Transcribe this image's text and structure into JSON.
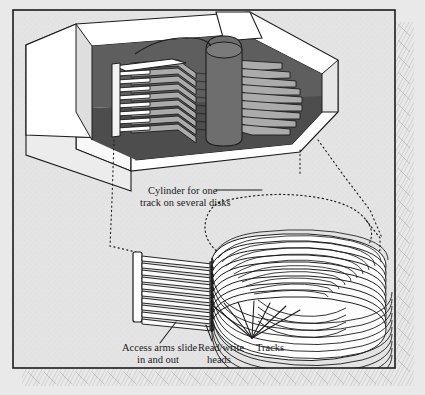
{
  "figure": {
    "type": "technical-illustration"
  },
  "labels": {
    "cylinder_line1": "Cylinder for one",
    "cylinder_line2": "track on several disks",
    "access_line1": "Access arms slide",
    "access_line2": "in and out",
    "heads_line1": "Read/write",
    "heads_line2": "heads",
    "tracks": "Tracks"
  },
  "colors": {
    "page_background": "#e9e9e9",
    "panel_background": "#e3e3e3",
    "frame_border": "#1c1c1c",
    "housing_white": "#fdfdfd",
    "housing_shade": "#d4d4d4",
    "interior_dark": "#585858",
    "interior_darker": "#4a4a4a",
    "platter_gray": "#a9a9a9",
    "spindle_gray": "#6e6e6e",
    "ink": "#1a1a1a",
    "shadow_hatch": "#b9b9b9"
  },
  "geometry": {
    "canvas_width": 425,
    "canvas_height": 395,
    "frame": {
      "x": 13,
      "y": 10,
      "width": 382,
      "height": 358
    },
    "platter_count_drive": 9,
    "access_arm_count": 10,
    "track_ring_count": 11
  }
}
